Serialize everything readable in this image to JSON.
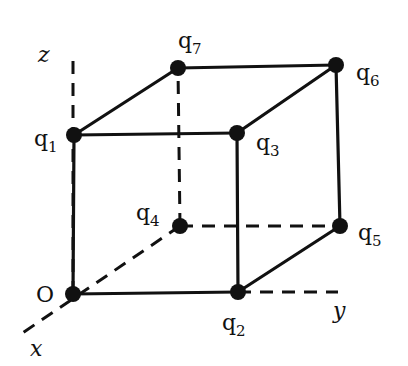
{
  "diagram": {
    "colors": {
      "ink": "#111111",
      "background": "#ffffff"
    },
    "axes": [
      {
        "name": "z",
        "label": "z",
        "from": [
          73,
          294
        ],
        "to": [
          73,
          60
        ],
        "label_pos": [
          38,
          62
        ]
      },
      {
        "name": "x",
        "label": "x",
        "from": [
          180,
          226
        ],
        "to": [
          18,
          336
        ],
        "label_pos": [
          30,
          356
        ]
      },
      {
        "name": "y",
        "label": "y",
        "from": [
          238,
          292
        ],
        "to": [
          338,
          292
        ],
        "label_pos": [
          333,
          318
        ]
      }
    ],
    "vertices": [
      {
        "id": "O",
        "label": "O",
        "x": 73,
        "y": 294,
        "label_pos": [
          36,
          302
        ]
      },
      {
        "id": "q1",
        "label": "q1",
        "x": 74,
        "y": 135,
        "label_pos": [
          34,
          146
        ]
      },
      {
        "id": "q2",
        "label": "q2",
        "x": 238,
        "y": 292,
        "label_pos": [
          222,
          330
        ]
      },
      {
        "id": "q3",
        "label": "q3",
        "x": 237,
        "y": 133,
        "label_pos": [
          256,
          150
        ]
      },
      {
        "id": "q4",
        "label": "q4",
        "x": 180,
        "y": 226,
        "label_pos": [
          136,
          220
        ]
      },
      {
        "id": "q5",
        "label": "q5",
        "x": 340,
        "y": 226,
        "label_pos": [
          358,
          240
        ]
      },
      {
        "id": "q6",
        "label": "q6",
        "x": 336,
        "y": 65,
        "label_pos": [
          356,
          80
        ]
      },
      {
        "id": "q7",
        "label": "q7",
        "x": 178,
        "y": 68,
        "label_pos": [
          178,
          48
        ]
      }
    ],
    "solid_edges": [
      [
        "O",
        "q1"
      ],
      [
        "O",
        "q2"
      ],
      [
        "q1",
        "q3"
      ],
      [
        "q2",
        "q3"
      ],
      [
        "q1",
        "q7"
      ],
      [
        "q7",
        "q6"
      ],
      [
        "q3",
        "q6"
      ],
      [
        "q6",
        "q5"
      ],
      [
        "q2",
        "q5"
      ]
    ],
    "hidden_edges": [
      [
        "q4",
        "q7"
      ],
      [
        "q4",
        "q5"
      ]
    ]
  }
}
